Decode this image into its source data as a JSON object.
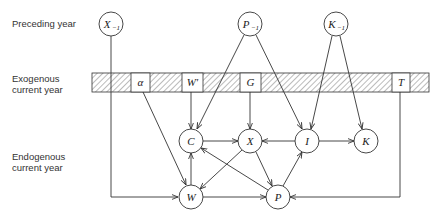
{
  "labels": {
    "preceding": "Preceding year",
    "exogenous_line1": "Exogenous",
    "exogenous_line2": "current year",
    "endogenous_line1": "Endogenous",
    "endogenous_line2": "current year"
  },
  "lagged_nodes": [
    {
      "id": "X-1",
      "main": "X",
      "sub": "−1"
    },
    {
      "id": "P-1",
      "main": "P",
      "sub": "−1"
    },
    {
      "id": "K-1",
      "main": "K",
      "sub": "−1"
    }
  ],
  "exogenous_boxes": [
    {
      "id": "alpha",
      "label": "α"
    },
    {
      "id": "Wprime",
      "label": "W′"
    },
    {
      "id": "G",
      "label": "G"
    },
    {
      "id": "T",
      "label": "T"
    }
  ],
  "endogenous_nodes": [
    {
      "id": "C",
      "label": "C"
    },
    {
      "id": "X",
      "label": "X"
    },
    {
      "id": "I",
      "label": "I"
    },
    {
      "id": "K",
      "label": "K"
    },
    {
      "id": "W",
      "label": "W"
    },
    {
      "id": "P",
      "label": "P"
    }
  ],
  "edges": [
    [
      "X-1",
      "W"
    ],
    [
      "P-1",
      "C"
    ],
    [
      "P-1",
      "I"
    ],
    [
      "K-1",
      "I"
    ],
    [
      "K-1",
      "K"
    ],
    [
      "alpha",
      "W"
    ],
    [
      "Wprime",
      "C"
    ],
    [
      "G",
      "X"
    ],
    [
      "T",
      "P"
    ],
    [
      "C",
      "X"
    ],
    [
      "I",
      "X"
    ],
    [
      "I",
      "K"
    ],
    [
      "W",
      "C"
    ],
    [
      "W",
      "P"
    ],
    [
      "X",
      "W"
    ],
    [
      "X",
      "P"
    ],
    [
      "P",
      "C"
    ],
    [
      "P",
      "I"
    ]
  ]
}
